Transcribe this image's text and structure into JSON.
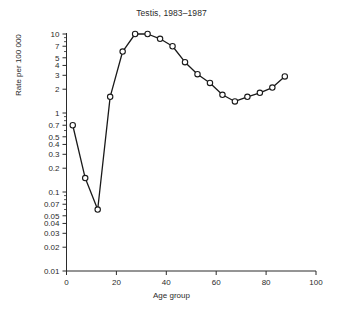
{
  "chart_data": {
    "type": "line",
    "title": "Testis, 1983–1987",
    "xlabel": "Age group",
    "ylabel": "Rate per 100 000",
    "yscale": "log",
    "xlim": [
      0,
      100
    ],
    "ylim": [
      0.01,
      12
    ],
    "grid": false,
    "legend": null,
    "marker": "open-circle",
    "line_color": "#1a1a1a",
    "marker_face_color": "#ffffff",
    "xticks": [
      0,
      20,
      40,
      60,
      80,
      100
    ],
    "xticklabels": [
      "0",
      "20",
      "40",
      "60",
      "80",
      "100"
    ],
    "yticks": [
      10,
      7,
      5,
      4,
      3,
      2,
      1,
      0.7,
      0.5,
      0.4,
      0.3,
      0.2,
      0.1,
      0.07,
      0.05,
      0.04,
      0.03,
      0.02,
      0.01
    ],
    "yticklabels": [
      "10",
      "7",
      "5",
      "4",
      "3",
      "2",
      "1",
      "0.7",
      "0.5",
      "0.4",
      "0.3",
      "0.2",
      "0.1",
      "0.07",
      "0.05",
      "0.04",
      "0.03",
      "0.02",
      "0.01"
    ],
    "series": [
      {
        "name": "Testis incidence rate",
        "x": [
          2.5,
          7.5,
          12.5,
          17.5,
          22.5,
          27.5,
          32.5,
          37.5,
          42.5,
          47.5,
          52.5,
          57.5,
          62.5,
          67.5,
          72.5,
          77.5,
          82.5,
          87.5
        ],
        "values": [
          0.7,
          0.15,
          0.06,
          1.6,
          6.0,
          10.0,
          10.0,
          8.7,
          7.0,
          4.4,
          3.1,
          2.4,
          1.7,
          1.4,
          1.6,
          1.8,
          2.1,
          2.9
        ]
      }
    ]
  }
}
